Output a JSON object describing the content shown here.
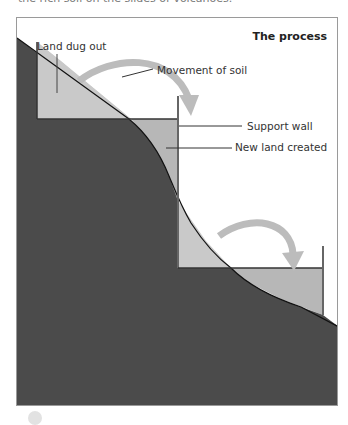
{
  "header": {
    "cut_text": "the rich soil on the slides of volcanoes."
  },
  "diagram": {
    "title": "The process",
    "labels": {
      "land_dug_out": "Land dug out",
      "movement_of_soil": "Movement of soil",
      "support_wall": "Support wall",
      "new_land_created": "New land created"
    },
    "colors": {
      "ground": "#4b4b4b",
      "dug_out_fill": "#c9c9c9",
      "new_land_fill": "#b7b7b7",
      "arrow": "#bcbcbc",
      "wall": "#666666"
    }
  }
}
